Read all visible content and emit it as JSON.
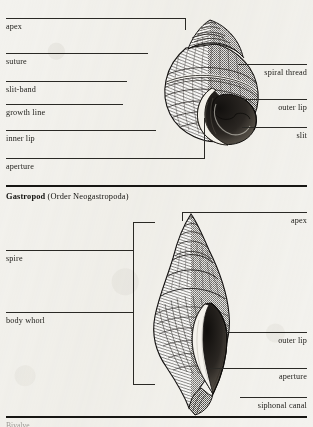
{
  "plate": {
    "width": 313,
    "height": 427,
    "paper_color": "#f3f2ee",
    "ink_color": "#1b1a17"
  },
  "figures": [
    {
      "id": "top-figure",
      "specimen": "archaeogastropod-shell",
      "caption": "",
      "left_labels": [
        {
          "name": "apex",
          "text": "apex",
          "rule_y": 18,
          "text_y": 22,
          "rule_x": 6,
          "rule_w": 180
        },
        {
          "name": "suture",
          "text": "suture",
          "rule_y": 53,
          "text_y": 57,
          "rule_x": 6,
          "rule_w": 142
        },
        {
          "name": "slit-band",
          "text": "slit-band",
          "rule_y": 81,
          "text_y": 85,
          "rule_x": 6,
          "rule_w": 121
        },
        {
          "name": "growth-line",
          "text": "growth line",
          "rule_y": 104,
          "text_y": 108,
          "rule_x": 6,
          "rule_w": 117
        },
        {
          "name": "inner-lip",
          "text": "inner lip",
          "rule_y": 130,
          "text_y": 134,
          "rule_x": 6,
          "rule_w": 150
        },
        {
          "name": "aperture",
          "text": "aperture",
          "rule_y": 158,
          "text_y": 162,
          "rule_x": 6,
          "rule_w": 199
        }
      ],
      "right_labels": [
        {
          "name": "spiral-thread",
          "text": "spiral thread",
          "rule_y": 64,
          "text_y": 68,
          "rule_x": 238,
          "rule_w": 69
        },
        {
          "name": "outer-lip",
          "text": "outer lip",
          "rule_y": 99,
          "text_y": 103,
          "rule_x": 240,
          "rule_w": 67
        },
        {
          "name": "slit",
          "text": "slit",
          "rule_y": 127,
          "text_y": 131,
          "rule_x": 242,
          "rule_w": 65
        }
      ]
    },
    {
      "id": "bottom-figure",
      "specimen": "neogastropod-shell",
      "caption_bold": "Gastropod",
      "caption_rest": " (Order Neogastropoda)",
      "left_labels": [
        {
          "name": "spire",
          "text": "spire",
          "rule_y": 250,
          "text_y": 254,
          "rule_x": 6,
          "rule_w": 127
        },
        {
          "name": "body-whorl",
          "text": "body whorl",
          "rule_y": 312,
          "text_y": 316,
          "rule_x": 6,
          "rule_w": 127
        }
      ],
      "right_labels": [
        {
          "name": "apex",
          "text": "apex",
          "rule_y": 212,
          "text_y": 216,
          "rule_x": 182,
          "rule_w": 125
        },
        {
          "name": "outer-lip",
          "text": "outer lip",
          "rule_y": 332,
          "text_y": 336,
          "rule_x": 225,
          "rule_w": 82
        },
        {
          "name": "aperture",
          "text": "aperture",
          "rule_y": 368,
          "text_y": 372,
          "rule_x": 210,
          "rule_w": 97
        },
        {
          "name": "siphonal-canal",
          "text": "siphonal canal",
          "rule_y": 397,
          "text_y": 401,
          "rule_x": 240,
          "rule_w": 67
        }
      ]
    }
  ],
  "dividers": [
    {
      "name": "section-divider-middle",
      "y": 185,
      "x": 6,
      "w": 301
    },
    {
      "name": "section-divider-bottom",
      "y": 416,
      "x": 6,
      "w": 301
    }
  ],
  "cut_off_text": "Bivalve"
}
